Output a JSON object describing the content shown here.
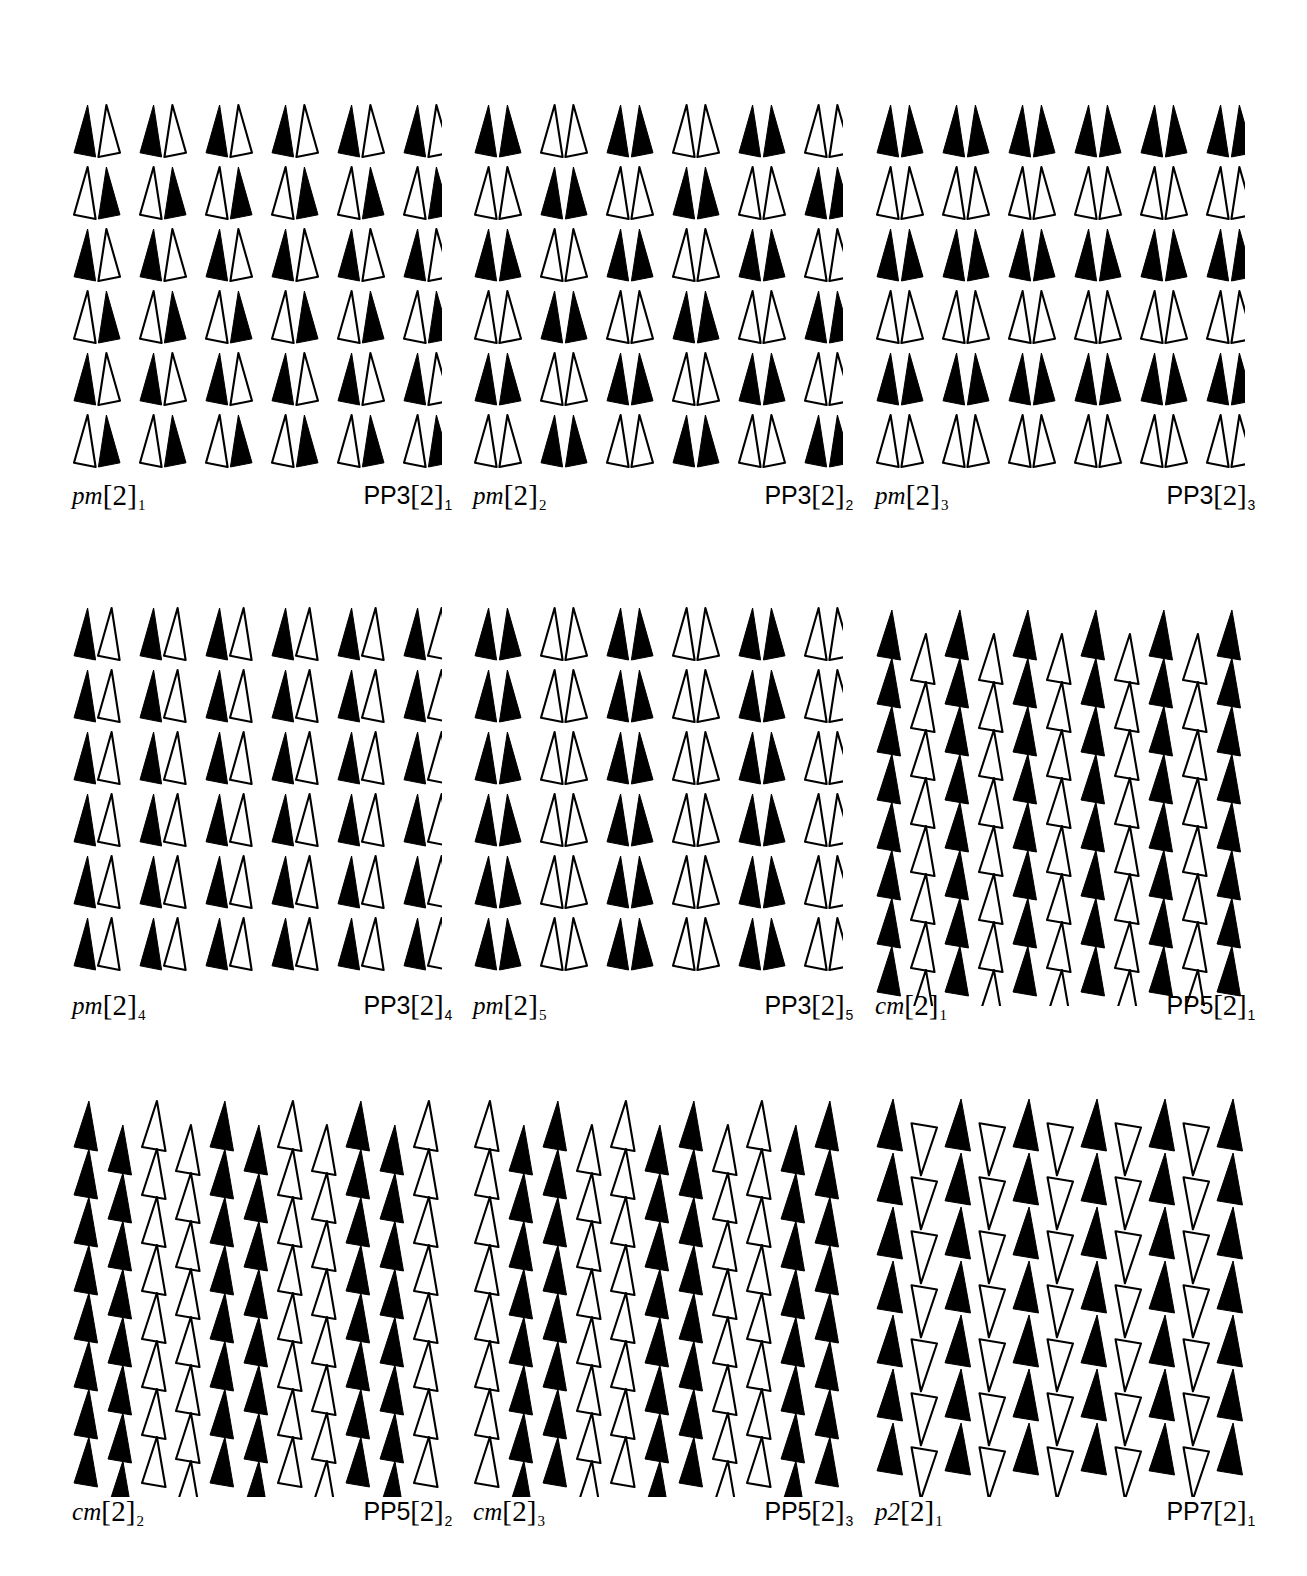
{
  "figure": {
    "kind": "tiling-pattern-plate",
    "background_color": "#ffffff",
    "ink_color": "#000000",
    "columns": 3,
    "rows": 3,
    "motif": "scalene-triangle",
    "motif_fills": [
      "solid-black",
      "outline-white"
    ]
  },
  "panels": [
    {
      "id": "p1",
      "label_left": "pm",
      "label_left_bracket": "[2]",
      "label_left_sub": "1",
      "label_right": "PP3",
      "label_right_bracket": "[2]",
      "label_right_sub": "1",
      "group": "pm",
      "pattern": "pm-1",
      "cols": 6,
      "rows": 6,
      "description": "Paired triangles; each cell is a black/white pair. Pair order flips every row (BW, WB, BW, WB, BW, WB).",
      "cells": [
        [
          "BW",
          "BW",
          "BW",
          "BW",
          "BW",
          "BW"
        ],
        [
          "WB",
          "WB",
          "WB",
          "WB",
          "WB",
          "WB"
        ],
        [
          "BW",
          "BW",
          "BW",
          "BW",
          "BW",
          "BW"
        ],
        [
          "WB",
          "WB",
          "WB",
          "WB",
          "WB",
          "WB"
        ],
        [
          "BW",
          "BW",
          "BW",
          "BW",
          "BW",
          "BW"
        ],
        [
          "WB",
          "WB",
          "WB",
          "WB",
          "WB",
          "WB"
        ]
      ],
      "mirror_pairs": true
    },
    {
      "id": "p2",
      "label_left": "pm",
      "label_left_bracket": "[2]",
      "label_left_sub": "2",
      "label_right": "PP3",
      "label_right_bracket": "[2]",
      "label_right_sub": "2",
      "group": "pm",
      "pattern": "pm-2",
      "cols": 6,
      "rows": 6,
      "description": "Mirrored pairs, both same colour; colour alternates along rows and flips each row.",
      "cells": [
        [
          "BB",
          "WW",
          "BB",
          "WW",
          "BB",
          "WW"
        ],
        [
          "WW",
          "BB",
          "WW",
          "BB",
          "WW",
          "BB"
        ],
        [
          "BB",
          "WW",
          "BB",
          "WW",
          "BB",
          "WW"
        ],
        [
          "WW",
          "BB",
          "WW",
          "BB",
          "WW",
          "BB"
        ],
        [
          "BB",
          "WW",
          "BB",
          "WW",
          "BB",
          "WW"
        ],
        [
          "WW",
          "BB",
          "WW",
          "BB",
          "WW",
          "BB"
        ]
      ],
      "mirror_pairs": true
    },
    {
      "id": "p3",
      "label_left": "pm",
      "label_left_bracket": "[2]",
      "label_left_sub": "3",
      "label_right": "PP3",
      "label_right_bracket": "[2]",
      "label_right_sub": "3",
      "group": "pm",
      "pattern": "pm-3",
      "cols": 6,
      "rows": 6,
      "description": "Mirrored pairs; entire rows alternate all-black / all-white.",
      "cells": [
        [
          "BB",
          "BB",
          "BB",
          "BB",
          "BB",
          "BB"
        ],
        [
          "WW",
          "WW",
          "WW",
          "WW",
          "WW",
          "WW"
        ],
        [
          "BB",
          "BB",
          "BB",
          "BB",
          "BB",
          "BB"
        ],
        [
          "WW",
          "WW",
          "WW",
          "WW",
          "WW",
          "WW"
        ],
        [
          "BB",
          "BB",
          "BB",
          "BB",
          "BB",
          "BB"
        ],
        [
          "WW",
          "WW",
          "WW",
          "WW",
          "WW",
          "WW"
        ]
      ],
      "mirror_pairs": true
    },
    {
      "id": "p4",
      "label_left": "pm",
      "label_left_bracket": "[2]",
      "label_left_sub": "4",
      "label_right": "PP3",
      "label_right_bracket": "[2]",
      "label_right_sub": "4",
      "group": "pm",
      "pattern": "pm-4",
      "cols": 6,
      "rows": 6,
      "description": "Every cell is a black triangle followed by a white triangle, identical in all rows.",
      "cells": [
        [
          "BW",
          "BW",
          "BW",
          "BW",
          "BW",
          "BW"
        ],
        [
          "BW",
          "BW",
          "BW",
          "BW",
          "BW",
          "BW"
        ],
        [
          "BW",
          "BW",
          "BW",
          "BW",
          "BW",
          "BW"
        ],
        [
          "BW",
          "BW",
          "BW",
          "BW",
          "BW",
          "BW"
        ],
        [
          "BW",
          "BW",
          "BW",
          "BW",
          "BW",
          "BW"
        ],
        [
          "BW",
          "BW",
          "BW",
          "BW",
          "BW",
          "BW"
        ]
      ],
      "mirror_pairs": false
    },
    {
      "id": "p5",
      "label_left": "pm",
      "label_left_bracket": "[2]",
      "label_left_sub": "5",
      "label_right": "PP3",
      "label_right_bracket": "[2]",
      "label_right_sub": "5",
      "group": "pm",
      "pattern": "pm-5",
      "cols": 6,
      "rows": 6,
      "description": "Mirrored pairs; columns strictly alternate black pair / white pair, same in every row.",
      "cells": [
        [
          "BB",
          "WW",
          "BB",
          "WW",
          "BB",
          "WW"
        ],
        [
          "BB",
          "WW",
          "BB",
          "WW",
          "BB",
          "WW"
        ],
        [
          "BB",
          "WW",
          "BB",
          "WW",
          "BB",
          "WW"
        ],
        [
          "BB",
          "WW",
          "BB",
          "WW",
          "BB",
          "WW"
        ],
        [
          "BB",
          "WW",
          "BB",
          "WW",
          "BB",
          "WW"
        ],
        [
          "BB",
          "WW",
          "BB",
          "WW",
          "BB",
          "WW"
        ]
      ],
      "mirror_pairs": true
    },
    {
      "id": "p6",
      "label_left": "cm",
      "label_left_bracket": "[2]",
      "label_left_sub": "1",
      "label_right": "PP5",
      "label_right_bracket": "[2]",
      "label_right_sub": "1",
      "group": "cm",
      "pattern": "cm-1",
      "cols": 6,
      "rows": 9,
      "description": "Staggered columns: column pairs offset by half a row. Colours alternate down each sub-column, giving glide-reflection columns of black and white.",
      "subcolumn_colors": [
        "B",
        "W",
        "B",
        "W",
        "B",
        "W",
        "B",
        "W",
        "B",
        "W",
        "B",
        "W"
      ],
      "stagger": "half-row offset on every second sub-column"
    },
    {
      "id": "p7",
      "label_left": "cm",
      "label_left_bracket": "[2]",
      "label_left_sub": "2",
      "label_right": "PP5",
      "label_right_bracket": "[2]",
      "label_right_sub": "2",
      "group": "cm",
      "pattern": "cm-2",
      "cols": 6,
      "rows": 9,
      "description": "Staggered columns as cm[2]1 but colour is constant per column pair: black pair column then white pair column.",
      "subcolumn_colors": [
        "B",
        "B",
        "W",
        "W",
        "B",
        "B",
        "W",
        "W",
        "B",
        "B",
        "W",
        "W"
      ],
      "stagger": "half-row offset on every second sub-column"
    },
    {
      "id": "p8",
      "label_left": "cm",
      "label_left_bracket": "[2]",
      "label_left_sub": "3",
      "label_right": "PP5",
      "label_right_bracket": "[2]",
      "label_right_sub": "3",
      "group": "cm",
      "pattern": "cm-3",
      "cols": 6,
      "rows": 9,
      "description": "Staggered columns; white sub-column then two black sub-columns then white, i.e. WBBW repeating.",
      "subcolumn_colors": [
        "W",
        "B",
        "B",
        "W",
        "W",
        "B",
        "B",
        "W",
        "W",
        "B",
        "B",
        "W"
      ],
      "stagger": "half-row offset on every second sub-column"
    },
    {
      "id": "p9",
      "label_left": "p2",
      "label_left_bracket": "[2]",
      "label_left_sub": "1",
      "label_right": "PP7",
      "label_right_bracket": "[2]",
      "label_right_sub": "1",
      "group": "p2",
      "pattern": "p2-1",
      "cols": 6,
      "rows": 8,
      "description": "Black upright triangles paired with white triangles rotated 180 degrees; the rotated white partner sits half a row lower.",
      "subcolumn_colors": [
        "B",
        "W",
        "B",
        "W",
        "B",
        "W",
        "B",
        "W",
        "B",
        "W",
        "B",
        "W"
      ],
      "rotation_white_deg": 180,
      "stagger": "half-row offset on the rotated white sub-column"
    }
  ],
  "geometry": {
    "panel_width": 380,
    "panel_height": 430,
    "col_x": [
      72,
      473,
      875
    ],
    "row_y": [
      103,
      606,
      1097
    ],
    "caption_y_offsets": [
      378,
      385,
      400
    ],
    "pm_cell_dx": 66,
    "pm_row_dy": 62,
    "pm_pair_gap": 25,
    "cm_sub_dx": 34,
    "cm_row_dy": 48,
    "triangle_width": 22,
    "triangle_height": 52,
    "stroke_width": 2.1
  }
}
